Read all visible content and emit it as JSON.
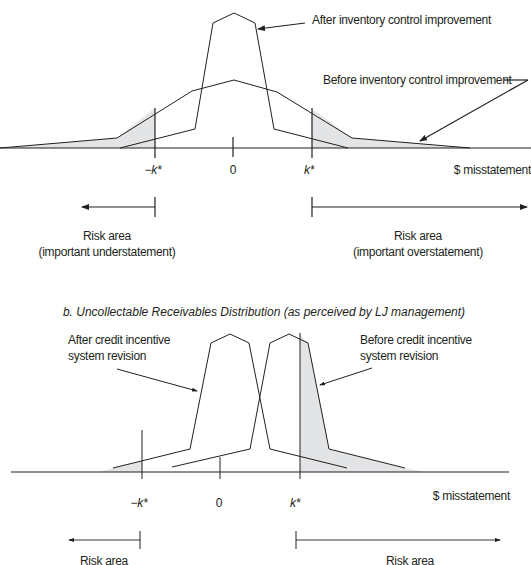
{
  "colors": {
    "line": "#231f20",
    "fill": "#e2e4e6",
    "background": "#ffffff"
  },
  "panel_a": {
    "annotations": {
      "after": "After inventory control improvement",
      "before": "Before inventory control improvement"
    },
    "axis": {
      "neg_k": "−k*",
      "zero": "0",
      "pos_k": "k*",
      "unit": "$ misstatement"
    },
    "risk_left": {
      "title": "Risk area",
      "subtitle": "(important understatement)"
    },
    "risk_right": {
      "title": "Risk area",
      "subtitle": "(important overstatement)"
    }
  },
  "panel_b": {
    "title": "b. Uncollectable Receivables Distribution (as perceived by LJ management)",
    "annotations": {
      "after_line1": "After credit incentive",
      "after_line2": "system revision",
      "before_line1": "Before credit incentive",
      "before_line2": "system revision"
    },
    "axis": {
      "neg_k": "−k*",
      "zero": "0",
      "pos_k": "k*",
      "unit": "$ misstatement"
    },
    "risk_left": {
      "title": "Risk area"
    },
    "risk_right": {
      "title": "Risk area"
    }
  }
}
